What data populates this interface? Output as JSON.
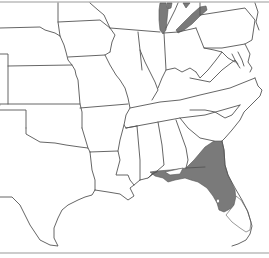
{
  "map": {
    "type": "species-range-map",
    "region": "Central and Eastern United States",
    "colors": {
      "background": "#ffffff",
      "state_border": "#555555",
      "range_fill": "#7a7a7a",
      "lake_fill": "#7a7a7a",
      "frame": "#9a9a9a"
    },
    "shaded_areas": [
      {
        "name": "range",
        "description": "Florida peninsula and southeastern Georgia"
      },
      {
        "name": "lake-michigan",
        "description": "Lake Michigan"
      },
      {
        "name": "lake-erie",
        "description": "Lake Erie"
      }
    ],
    "unshaded_holes": [
      {
        "name": "lake-okeechobee",
        "description": "Small unshaded area within southern Florida"
      },
      {
        "name": "south-florida",
        "description": "Southern tip of Florida unshaded"
      }
    ],
    "labels": []
  }
}
